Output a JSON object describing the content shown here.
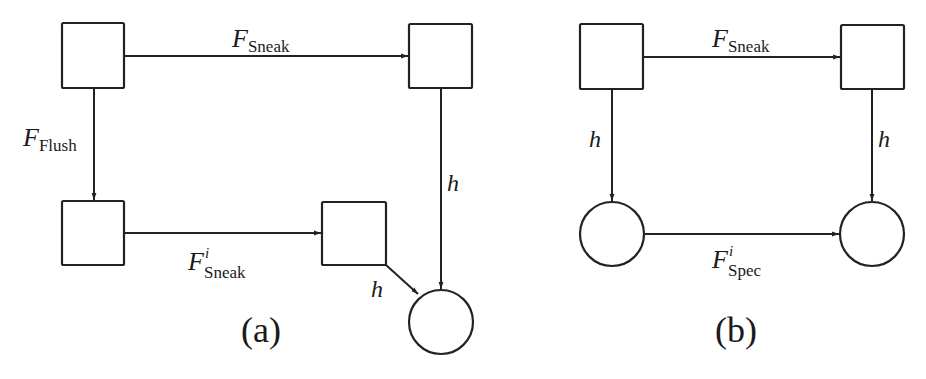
{
  "figure_a": {
    "caption": "(a)",
    "nodes": [
      {
        "id": "a_tl",
        "shape": "square"
      },
      {
        "id": "a_tr",
        "shape": "square"
      },
      {
        "id": "a_bl",
        "shape": "square"
      },
      {
        "id": "a_bm",
        "shape": "square"
      },
      {
        "id": "a_circle",
        "shape": "circle"
      }
    ],
    "edges": [
      {
        "from": "a_tl",
        "to": "a_tr",
        "label_main": "F",
        "label_sub": "Sneak",
        "label_sup": ""
      },
      {
        "from": "a_tl",
        "to": "a_bl",
        "label_main": "F",
        "label_sub": "Flush",
        "label_sup": ""
      },
      {
        "from": "a_bl",
        "to": "a_bm",
        "label_main": "F",
        "label_sub": "Sneak",
        "label_sup": "i"
      },
      {
        "from": "a_tr",
        "to": "a_circle",
        "label_main": "h"
      },
      {
        "from": "a_bm",
        "to": "a_circle",
        "label_main": "h"
      }
    ]
  },
  "figure_b": {
    "caption": "(b)",
    "nodes": [
      {
        "id": "b_tl",
        "shape": "square"
      },
      {
        "id": "b_tr",
        "shape": "square"
      },
      {
        "id": "b_bl",
        "shape": "circle"
      },
      {
        "id": "b_br",
        "shape": "circle"
      }
    ],
    "edges": [
      {
        "from": "b_tl",
        "to": "b_tr",
        "label_main": "F",
        "label_sub": "Sneak",
        "label_sup": ""
      },
      {
        "from": "b_tl",
        "to": "b_bl",
        "label_main": "h"
      },
      {
        "from": "b_tr",
        "to": "b_br",
        "label_main": "h"
      },
      {
        "from": "b_bl",
        "to": "b_br",
        "label_main": "F",
        "label_sub": "Spec",
        "label_sup": "i"
      }
    ]
  },
  "colors": {
    "stroke": "#222222",
    "background": "#ffffff"
  }
}
